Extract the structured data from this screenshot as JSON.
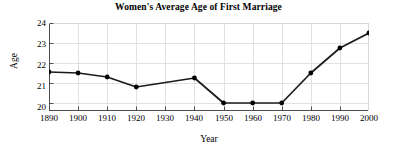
{
  "chart_data": {
    "type": "line",
    "title": "Women's Average Age of First Marriage",
    "xlabel": "Year",
    "ylabel": "Age",
    "grid": true,
    "legend": false,
    "xlim": [
      1890,
      2000
    ],
    "ylim": [
      19.6,
      24
    ],
    "xticks": [
      1890,
      1900,
      1910,
      1920,
      1930,
      1940,
      1950,
      1960,
      1970,
      1980,
      1990,
      2000
    ],
    "xtick_labels": [
      "1890",
      "1900",
      "1910",
      "1920",
      "1930",
      "1940",
      "1950",
      "1960",
      "1970",
      "1980",
      "1990",
      "2000"
    ],
    "yticks": [
      20,
      21,
      22,
      23,
      24
    ],
    "ytick_labels": [
      "20",
      "21",
      "22",
      "23",
      "24"
    ],
    "x": [
      1890,
      1900,
      1910,
      1920,
      1940,
      1950,
      1960,
      1970,
      1980,
      1990,
      2000
    ],
    "values": [
      21.55,
      21.5,
      21.3,
      20.8,
      21.25,
      20.0,
      20.0,
      20.0,
      21.5,
      22.75,
      23.5
    ],
    "markers": [
      {
        "x": 1890,
        "y": 21.55
      },
      {
        "x": 1900,
        "y": 21.5
      },
      {
        "x": 1910,
        "y": 21.3
      },
      {
        "x": 1920,
        "y": 20.8
      },
      {
        "x": 1940,
        "y": 21.25
      },
      {
        "x": 1950,
        "y": 20.0
      },
      {
        "x": 1960,
        "y": 20.0
      },
      {
        "x": 1970,
        "y": 20.0
      },
      {
        "x": 1980,
        "y": 21.5
      },
      {
        "x": 1990,
        "y": 22.75
      },
      {
        "x": 2000,
        "y": 23.5
      }
    ],
    "line_color": "#1a1a1a",
    "marker_color": "#000000",
    "grid_color": "#d9d9d9",
    "axis_color": "#808080",
    "background": "#ffffff"
  }
}
